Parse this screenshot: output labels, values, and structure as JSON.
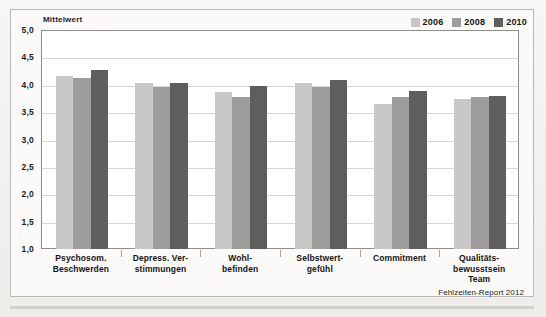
{
  "chart_data": {
    "type": "bar",
    "title": "",
    "axis_title": "Mittelwert",
    "xlabel": "",
    "ylabel": "Mittelwert",
    "ylim": [
      1.0,
      5.0
    ],
    "ytick_step": 0.5,
    "grid": true,
    "legend_position": "top-right",
    "source": "Fehlzeiten-Report 2012",
    "ytick_labels": [
      "5,0",
      "4,5",
      "4,0",
      "3,5",
      "3,0",
      "2,5",
      "2,0",
      "1,5",
      "1,0"
    ],
    "ytick_values": [
      5.0,
      4.5,
      4.0,
      3.5,
      3.0,
      2.5,
      2.0,
      1.5,
      1.0
    ],
    "categories": [
      "Psychosom.\nBeschwerden",
      "Depress. Ver-\nstimmungen",
      "Wohl-\nbefinden",
      "Selbstwert-\ngefühl",
      "Commitment",
      "Qualitäts-\nbewusstsein\nTeam"
    ],
    "category_lines": [
      [
        "Psychosom.",
        "Beschwerden"
      ],
      [
        "Depress. Ver-",
        "stimmungen"
      ],
      [
        "Wohl-",
        "befinden"
      ],
      [
        "Selbstwert-",
        "gefühl"
      ],
      [
        "Commitment"
      ],
      [
        "Qualitäts-",
        "bewusstsein",
        "Team"
      ]
    ],
    "series": [
      {
        "name": "2006",
        "color": "#c9c8c6",
        "values": [
          4.18,
          4.05,
          3.88,
          4.05,
          3.67,
          3.75
        ]
      },
      {
        "name": "2008",
        "color": "#9e9d9b",
        "values": [
          4.15,
          3.97,
          3.8,
          3.98,
          3.8,
          3.8
        ]
      },
      {
        "name": "2010",
        "color": "#5f5e5d",
        "values": [
          4.28,
          4.05,
          4.0,
          4.1,
          3.9,
          3.82
        ]
      }
    ]
  },
  "legend": {
    "entries": [
      {
        "label": "2006",
        "color": "#c9c8c6"
      },
      {
        "label": "2008",
        "color": "#9e9d9b"
      },
      {
        "label": "2010",
        "color": "#5f5e5d"
      }
    ]
  },
  "footer": {
    "source": "Fehlzeiten-Report 2012"
  }
}
